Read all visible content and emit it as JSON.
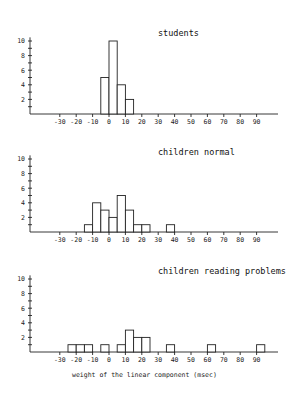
{
  "chart_data": [
    {
      "type": "bar",
      "title": "students",
      "xlabel": "",
      "ylabel": "",
      "bin_width": 5,
      "bins": [
        {
          "from": -5,
          "to": 0,
          "count": 5
        },
        {
          "from": 0,
          "to": 5,
          "count": 10
        },
        {
          "from": 5,
          "to": 10,
          "count": 4
        },
        {
          "from": 10,
          "to": 15,
          "count": 2
        }
      ],
      "xticks": [
        -30,
        -20,
        -10,
        0,
        10,
        20,
        30,
        40,
        50,
        60,
        70,
        80,
        90
      ],
      "yticks": [
        2,
        4,
        6,
        8,
        10
      ],
      "xlim": [
        -45,
        100
      ],
      "ylim": [
        0,
        10.5
      ],
      "grid": false,
      "legend": null
    },
    {
      "type": "bar",
      "title": "children normal",
      "xlabel": "",
      "ylabel": "",
      "bin_width": 5,
      "bins": [
        {
          "from": -15,
          "to": -10,
          "count": 1
        },
        {
          "from": -10,
          "to": -5,
          "count": 4
        },
        {
          "from": -5,
          "to": 0,
          "count": 3
        },
        {
          "from": 0,
          "to": 5,
          "count": 2
        },
        {
          "from": 5,
          "to": 10,
          "count": 5
        },
        {
          "from": 10,
          "to": 15,
          "count": 3
        },
        {
          "from": 15,
          "to": 20,
          "count": 1
        },
        {
          "from": 20,
          "to": 25,
          "count": 1
        },
        {
          "from": 35,
          "to": 40,
          "count": 1
        }
      ],
      "xticks": [
        -30,
        -20,
        -10,
        0,
        10,
        20,
        30,
        40,
        50,
        60,
        70,
        80,
        90
      ],
      "yticks": [
        2,
        4,
        6,
        8,
        10
      ],
      "xlim": [
        -45,
        100
      ],
      "ylim": [
        0,
        10.5
      ],
      "grid": false,
      "legend": null
    },
    {
      "type": "bar",
      "title": "children reading problems",
      "xlabel": "weight of the linear component (msec)",
      "ylabel": "",
      "bin_width": 5,
      "bins": [
        {
          "from": -25,
          "to": -20,
          "count": 1
        },
        {
          "from": -20,
          "to": -15,
          "count": 1
        },
        {
          "from": -15,
          "to": -10,
          "count": 1
        },
        {
          "from": -5,
          "to": 0,
          "count": 1
        },
        {
          "from": 5,
          "to": 10,
          "count": 1
        },
        {
          "from": 10,
          "to": 15,
          "count": 3
        },
        {
          "from": 15,
          "to": 20,
          "count": 2
        },
        {
          "from": 20,
          "to": 25,
          "count": 2
        },
        {
          "from": 35,
          "to": 40,
          "count": 1
        },
        {
          "from": 60,
          "to": 65,
          "count": 1
        },
        {
          "from": 90,
          "to": 95,
          "count": 1
        }
      ],
      "xticks": [
        -30,
        -20,
        -10,
        0,
        10,
        20,
        30,
        40,
        50,
        60,
        70,
        80,
        90
      ],
      "yticks": [
        2,
        4,
        6,
        8,
        10
      ],
      "xlim": [
        -45,
        100
      ],
      "ylim": [
        0,
        10.5
      ],
      "grid": false,
      "legend": null
    }
  ],
  "panels": [
    {
      "title": "students"
    },
    {
      "title": "children normal"
    },
    {
      "title": "children reading problems"
    }
  ],
  "xlabel": "weight of the linear component (msec)"
}
